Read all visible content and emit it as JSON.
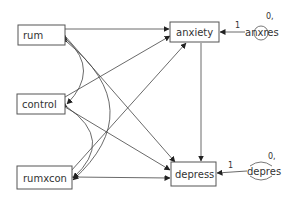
{
  "diagram": {
    "type": "path-diagram",
    "observed": [
      {
        "id": "rum",
        "label": "rum"
      },
      {
        "id": "control",
        "label": "control"
      },
      {
        "id": "rumxcon",
        "label": "rumxcon"
      },
      {
        "id": "anxiety",
        "label": "anxiety"
      },
      {
        "id": "depress",
        "label": "depress"
      }
    ],
    "errors": [
      {
        "id": "anxres",
        "label": "anxres",
        "mean_var": "0,",
        "path_label": "1",
        "target": "anxiety"
      },
      {
        "id": "depres",
        "label": "depres",
        "mean_var": "0,",
        "path_label": "1",
        "target": "depress"
      }
    ],
    "paths": [
      {
        "from": "rum",
        "to": "anxiety"
      },
      {
        "from": "rum",
        "to": "depress"
      },
      {
        "from": "control",
        "to": "anxiety"
      },
      {
        "from": "control",
        "to": "depress"
      },
      {
        "from": "rumxcon",
        "to": "anxiety"
      },
      {
        "from": "rumxcon",
        "to": "depress"
      },
      {
        "from": "anxiety",
        "to": "depress"
      }
    ],
    "covariances": [
      {
        "between": [
          "rum",
          "control"
        ]
      },
      {
        "between": [
          "rum",
          "rumxcon"
        ]
      },
      {
        "between": [
          "control",
          "rumxcon"
        ]
      }
    ]
  }
}
